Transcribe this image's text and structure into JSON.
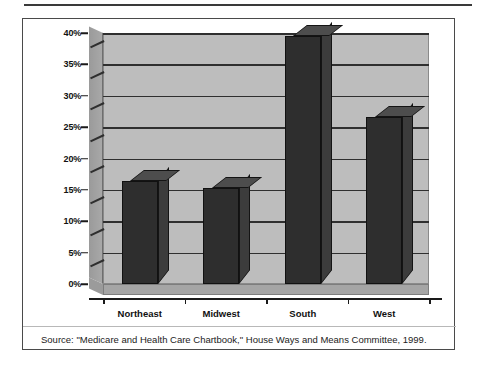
{
  "figure": {
    "source_note": "Source:  \"Medicare and Health Care Chartbook,\" House Ways and Means Committee, 1999."
  },
  "chart_data": {
    "type": "bar",
    "title": "",
    "subtitle": "",
    "xlabel": "",
    "ylabel": "",
    "categories": [
      "Northeast",
      "Midwest",
      "South",
      "West"
    ],
    "values": [
      16.4,
      15.3,
      39.6,
      26.6
    ],
    "value_labels": [
      "16%",
      "15%",
      "40%",
      "26.5%"
    ],
    "ylim": [
      0,
      40
    ],
    "ytick_values": [
      0,
      5,
      10,
      15,
      20,
      25,
      30,
      35,
      40
    ],
    "ytick_labels": [
      "0%",
      "5%",
      "10%",
      "15%",
      "20%",
      "25%",
      "30%",
      "35%",
      "40%"
    ],
    "grid": true,
    "legend": "none",
    "style": "3d-column",
    "colors": {
      "bar_front": "#2e2e2e",
      "bar_top": "#4d4d4d",
      "bar_side": "#3c3c3c",
      "plot_background": "#bdbdbd",
      "gridline": "#2f2f2f",
      "text": "#111111"
    }
  }
}
